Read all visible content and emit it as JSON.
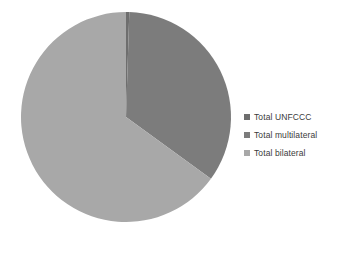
{
  "chart_data": {
    "type": "pie",
    "title": "",
    "categories": [
      "Total UNFCCC",
      "Total multilateral",
      "Total bilateral"
    ],
    "values": [
      0.5,
      34.5,
      65.0
    ],
    "value_unit": "percent",
    "slice_colors": [
      "#6e6e6e",
      "#7c7c7c",
      "#a8a8a8"
    ],
    "start_angle_deg": 0,
    "direction": "clockwise",
    "legend_position": "right",
    "grid": false,
    "data_labels_shown": false,
    "axis_labels_shown": false
  },
  "legend": {
    "items": [
      {
        "label": "Total UNFCCC",
        "color": "#6e6e6e"
      },
      {
        "label": "Total multilateral",
        "color": "#7c7c7c"
      },
      {
        "label": "Total bilateral",
        "color": "#a8a8a8"
      }
    ]
  },
  "pie": {
    "center_x": 126,
    "center_y": 117,
    "radius": 105
  }
}
